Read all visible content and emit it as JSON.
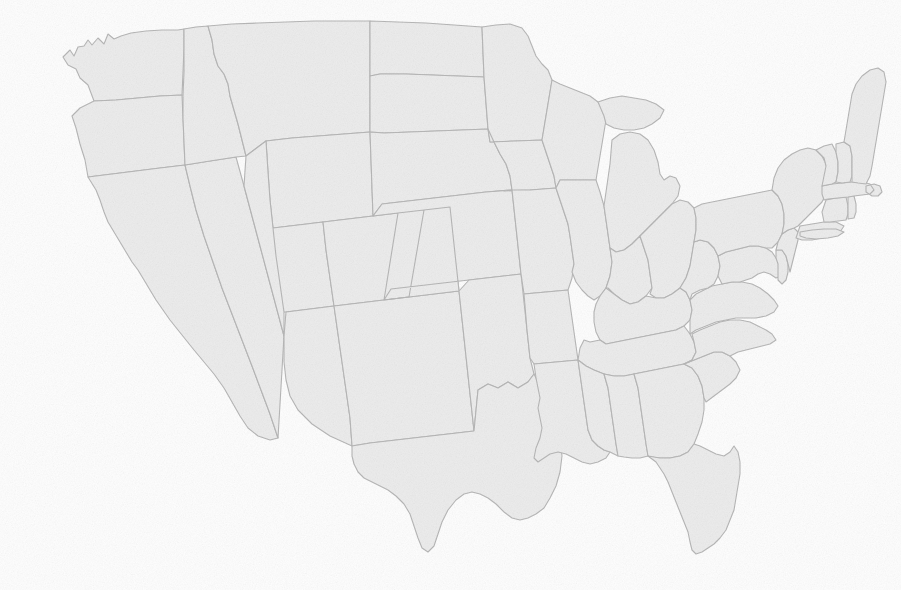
{
  "document": {
    "kind": "map",
    "title": "United States",
    "subject": "Contiguous United States state boundaries",
    "projection": "albers-usa",
    "width": 901,
    "height": 590
  },
  "style": {
    "background_color": "#ffffff",
    "state_fill_color": "#ededed",
    "state_border_color": "#b5b5b5",
    "coastline_color": "#b9b9b9",
    "border_width_px": 1.1,
    "texture": "fine grayscale noise grain",
    "overall_tone": "very faint light gray, low contrast"
  },
  "map": {
    "bounds": {
      "left": 40,
      "top": 28,
      "right": 880,
      "bottom": 560
    },
    "label_visible": false,
    "legend_visible": false,
    "graticule_visible": false,
    "regions_shown": [
      "Pacific Northwest",
      "California",
      "Mountain West",
      "Great Plains",
      "Midwest",
      "Great Lakes",
      "Northeast",
      "Mid-Atlantic",
      "Southeast",
      "Gulf Coast",
      "Texas",
      "Florida Peninsula"
    ],
    "water_bodies_as_voids": [
      "Lake Superior",
      "Lake Michigan",
      "Lake Huron",
      "Lake Erie",
      "Lake Ontario",
      "Chesapeake Bay",
      "Gulf of Mexico",
      "Atlantic Ocean",
      "Pacific Ocean"
    ],
    "states": [
      {
        "code": "WA",
        "name": "Washington"
      },
      {
        "code": "OR",
        "name": "Oregon"
      },
      {
        "code": "CA",
        "name": "California"
      },
      {
        "code": "NV",
        "name": "Nevada"
      },
      {
        "code": "ID",
        "name": "Idaho"
      },
      {
        "code": "MT",
        "name": "Montana"
      },
      {
        "code": "WY",
        "name": "Wyoming"
      },
      {
        "code": "UT",
        "name": "Utah"
      },
      {
        "code": "AZ",
        "name": "Arizona"
      },
      {
        "code": "CO",
        "name": "Colorado"
      },
      {
        "code": "NM",
        "name": "New Mexico"
      },
      {
        "code": "ND",
        "name": "North Dakota"
      },
      {
        "code": "SD",
        "name": "South Dakota"
      },
      {
        "code": "NE",
        "name": "Nebraska"
      },
      {
        "code": "KS",
        "name": "Kansas"
      },
      {
        "code": "OK",
        "name": "Oklahoma"
      },
      {
        "code": "TX",
        "name": "Texas"
      },
      {
        "code": "MN",
        "name": "Minnesota"
      },
      {
        "code": "IA",
        "name": "Iowa"
      },
      {
        "code": "MO",
        "name": "Missouri"
      },
      {
        "code": "AR",
        "name": "Arkansas"
      },
      {
        "code": "LA",
        "name": "Louisiana"
      },
      {
        "code": "WI",
        "name": "Wisconsin"
      },
      {
        "code": "IL",
        "name": "Illinois"
      },
      {
        "code": "MI",
        "name": "Michigan"
      },
      {
        "code": "IN",
        "name": "Indiana"
      },
      {
        "code": "OH",
        "name": "Ohio"
      },
      {
        "code": "KY",
        "name": "Kentucky"
      },
      {
        "code": "TN",
        "name": "Tennessee"
      },
      {
        "code": "MS",
        "name": "Mississippi"
      },
      {
        "code": "AL",
        "name": "Alabama"
      },
      {
        "code": "GA",
        "name": "Georgia"
      },
      {
        "code": "FL",
        "name": "Florida"
      },
      {
        "code": "SC",
        "name": "South Carolina"
      },
      {
        "code": "NC",
        "name": "North Carolina"
      },
      {
        "code": "VA",
        "name": "Virginia"
      },
      {
        "code": "WV",
        "name": "West Virginia"
      },
      {
        "code": "MD",
        "name": "Maryland"
      },
      {
        "code": "DE",
        "name": "Delaware"
      },
      {
        "code": "PA",
        "name": "Pennsylvania"
      },
      {
        "code": "NJ",
        "name": "New Jersey"
      },
      {
        "code": "NY",
        "name": "New York"
      },
      {
        "code": "CT",
        "name": "Connecticut"
      },
      {
        "code": "RI",
        "name": "Rhode Island"
      },
      {
        "code": "MA",
        "name": "Massachusetts"
      },
      {
        "code": "VT",
        "name": "Vermont"
      },
      {
        "code": "NH",
        "name": "New Hampshire"
      },
      {
        "code": "ME",
        "name": "Maine"
      }
    ]
  }
}
